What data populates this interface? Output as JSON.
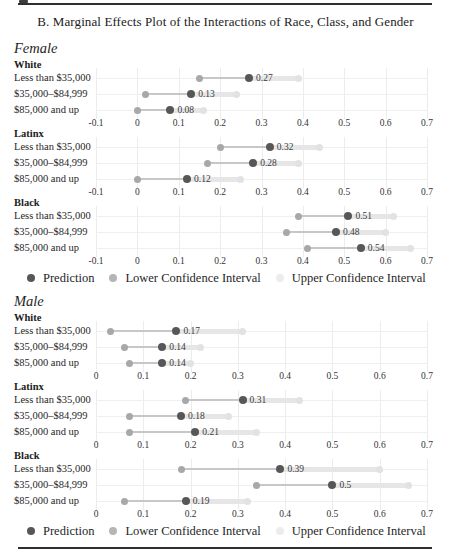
{
  "title": "B. Marginal Effects Plot of the Interactions of Race, Class, and Gender",
  "legend": {
    "prediction": "Prediction",
    "lower": "Lower Confidence Interval",
    "upper": "Upper Confidence Interval"
  },
  "colors": {
    "prediction_dot": "#575757",
    "lower_ci_dot": "#a8a8a8",
    "upper_ci_dot": "#e2e2e2",
    "ci_band": "#e6e6e6",
    "gridline": "#ececec",
    "text": "#222222"
  },
  "chart_data": {
    "type": "scatter",
    "title": "B. Marginal Effects Plot of the Interactions of Race, Class, and Gender",
    "orientation": "horizontal-dot-plot",
    "grid": true,
    "legend_entries": [
      "Prediction",
      "Lower Confidence Interval",
      "Upper Confidence Interval"
    ],
    "panels": [
      {
        "label": "Female",
        "axis": {
          "min": -0.1,
          "max": 0.7,
          "ticks": [
            "-0.1",
            "0",
            "0.1",
            "0.2",
            "0.3",
            "0.4",
            "0.5",
            "0.6",
            "0.7"
          ]
        },
        "groups": [
          {
            "label": "White",
            "rows": [
              {
                "label": "Less than $35,000",
                "prediction": 0.27,
                "lower": 0.15,
                "upper": 0.39,
                "value_label": "0.27"
              },
              {
                "label": "$35,000–$84,999",
                "prediction": 0.13,
                "lower": 0.02,
                "upper": 0.24,
                "value_label": "0.13"
              },
              {
                "label": "$85,000 and up",
                "prediction": 0.08,
                "lower": 0.0,
                "upper": 0.16,
                "value_label": "0.08"
              }
            ]
          },
          {
            "label": "Latinx",
            "rows": [
              {
                "label": "Less than $35,000",
                "prediction": 0.32,
                "lower": 0.2,
                "upper": 0.44,
                "value_label": "0.32"
              },
              {
                "label": "$35,000–$84,999",
                "prediction": 0.28,
                "lower": 0.17,
                "upper": 0.39,
                "value_label": "0.28"
              },
              {
                "label": "$85,000 and up",
                "prediction": 0.12,
                "lower": 0.0,
                "upper": 0.25,
                "value_label": "0.12"
              }
            ]
          },
          {
            "label": "Black",
            "rows": [
              {
                "label": "Less than $35,000",
                "prediction": 0.51,
                "lower": 0.39,
                "upper": 0.62,
                "value_label": "0.51"
              },
              {
                "label": "$35,000–$84,999",
                "prediction": 0.48,
                "lower": 0.36,
                "upper": 0.6,
                "value_label": "0.48"
              },
              {
                "label": "$85,000 and up",
                "prediction": 0.54,
                "lower": 0.41,
                "upper": 0.66,
                "value_label": "0.54"
              }
            ]
          }
        ]
      },
      {
        "label": "Male",
        "axis": {
          "min": 0,
          "max": 0.7,
          "ticks": [
            "0",
            "0.1",
            "0.2",
            "0.3",
            "0.4",
            "0.5",
            "0.6",
            "0.7"
          ]
        },
        "groups": [
          {
            "label": "White",
            "rows": [
              {
                "label": "Less than $35,000",
                "prediction": 0.17,
                "lower": 0.03,
                "upper": 0.31,
                "value_label": "0.17"
              },
              {
                "label": "$35,000–$84,999",
                "prediction": 0.14,
                "lower": 0.06,
                "upper": 0.22,
                "value_label": "0.14"
              },
              {
                "label": "$85,000 and up",
                "prediction": 0.14,
                "lower": 0.07,
                "upper": 0.2,
                "value_label": "0.14"
              }
            ]
          },
          {
            "label": "Latinx",
            "rows": [
              {
                "label": "Less than $35,000",
                "prediction": 0.31,
                "lower": 0.19,
                "upper": 0.43,
                "value_label": "0.31"
              },
              {
                "label": "$35,000–$84,999",
                "prediction": 0.18,
                "lower": 0.07,
                "upper": 0.28,
                "value_label": "0.18"
              },
              {
                "label": "$85,000 and up",
                "prediction": 0.21,
                "lower": 0.07,
                "upper": 0.34,
                "value_label": "0.21"
              }
            ]
          },
          {
            "label": "Black",
            "rows": [
              {
                "label": "Less than $35,000",
                "prediction": 0.39,
                "lower": 0.18,
                "upper": 0.6,
                "value_label": "0.39"
              },
              {
                "label": "$35,000–$84,999",
                "prediction": 0.5,
                "lower": 0.34,
                "upper": 0.66,
                "value_label": "0.5"
              },
              {
                "label": "$85,000 and up",
                "prediction": 0.19,
                "lower": 0.06,
                "upper": 0.32,
                "value_label": "0.19"
              }
            ]
          }
        ]
      }
    ]
  }
}
